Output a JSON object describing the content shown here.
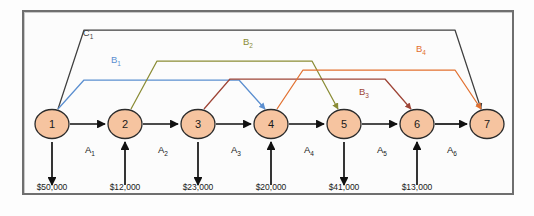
{
  "diagram": {
    "frame_color": "#6f6f6f",
    "background": "#fcfcfc",
    "node_fill": "#f6c4a0",
    "node_stroke": "#2b2b2b",
    "nodes": [
      {
        "id": "1",
        "label": "1",
        "x": 52,
        "y": 124
      },
      {
        "id": "2",
        "label": "2",
        "x": 125,
        "y": 124
      },
      {
        "id": "3",
        "label": "3",
        "x": 198,
        "y": 124
      },
      {
        "id": "4",
        "label": "4",
        "x": 271,
        "y": 124
      },
      {
        "id": "5",
        "label": "5",
        "x": 344,
        "y": 124
      },
      {
        "id": "6",
        "label": "6",
        "x": 417,
        "y": 124
      },
      {
        "id": "7",
        "label": "7",
        "x": 487,
        "y": 124
      }
    ],
    "node_radius": 17,
    "horizontal_arrows": [
      {
        "label": "A",
        "sub": "1",
        "from": "1",
        "to": "2",
        "label_x": 90,
        "label_y": 153
      },
      {
        "label": "A",
        "sub": "2",
        "from": "2",
        "to": "3",
        "label_x": 163,
        "label_y": 153
      },
      {
        "label": "A",
        "sub": "3",
        "from": "3",
        "to": "4",
        "label_x": 236,
        "label_y": 153
      },
      {
        "label": "A",
        "sub": "4",
        "from": "4",
        "to": "5",
        "label_x": 309,
        "label_y": 153
      },
      {
        "label": "A",
        "sub": "5",
        "from": "5",
        "to": "6",
        "label_x": 382,
        "label_y": 153
      },
      {
        "label": "A",
        "sub": "6",
        "from": "6",
        "to": "7",
        "label_x": 452,
        "label_y": 153
      }
    ],
    "cash_flows": [
      {
        "node": "1",
        "amount": "$50,000",
        "direction": "down",
        "x": 52
      },
      {
        "node": "2",
        "amount": "$12,000",
        "direction": "up",
        "x": 125
      },
      {
        "node": "3",
        "amount": "$23,000",
        "direction": "down",
        "x": 198
      },
      {
        "node": "4",
        "amount": "$20,000",
        "direction": "up",
        "x": 271
      },
      {
        "node": "5",
        "amount": "$41,000",
        "direction": "down",
        "x": 344
      },
      {
        "node": "6",
        "amount": "$13,000",
        "direction": "up",
        "x": 417
      }
    ],
    "money_label_y": 190,
    "arcs": [
      {
        "id": "C1",
        "label": "C",
        "sub": "1",
        "color": "#3f3f3f",
        "from": "1",
        "to": "7",
        "plateau_y": 30,
        "label_x": 88,
        "label_y": 36
      },
      {
        "id": "B1",
        "label": "B",
        "sub": "1",
        "color": "#5b8fd0",
        "from": "1",
        "to": "4",
        "plateau_y": 80,
        "label_x": 116,
        "label_y": 63
      },
      {
        "id": "B2",
        "label": "B",
        "sub": "2",
        "color": "#8a8c35",
        "from": "2",
        "to": "5",
        "plateau_y": 61,
        "label_x": 248,
        "label_y": 45
      },
      {
        "id": "B3",
        "label": "B",
        "sub": "3",
        "color": "#9e4436",
        "from": "3",
        "to": "6",
        "plateau_y": 79,
        "label_x": 364,
        "label_y": 95
      },
      {
        "id": "B4",
        "label": "B",
        "sub": "4",
        "color": "#e2702f",
        "from": "4",
        "to": "7",
        "plateau_y": 70,
        "label_x": 421,
        "label_y": 52
      }
    ]
  }
}
